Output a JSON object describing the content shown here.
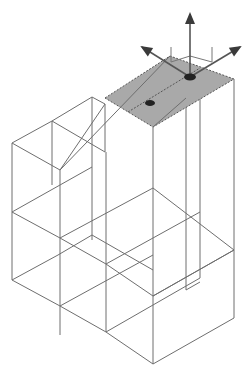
{
  "diagram": {
    "title": "",
    "colors": {
      "background": "#ffffff",
      "edge": "#6e6e6e",
      "selected_face": "#a9a9a9",
      "gizmo": "#3a3a3a"
    },
    "edges": [
      [
        12,
        143,
        52,
        121
      ],
      [
        52,
        121,
        92,
        97
      ],
      [
        12,
        143,
        12,
        280
      ],
      [
        52,
        121,
        52,
        185
      ],
      [
        92,
        97,
        92,
        240
      ],
      [
        12,
        143,
        60,
        170
      ],
      [
        52,
        121,
        105,
        152
      ],
      [
        92,
        97,
        105,
        104
      ],
      [
        60,
        170,
        60,
        335
      ],
      [
        60,
        170,
        105,
        104
      ],
      [
        12,
        212,
        60,
        238
      ],
      [
        12,
        212,
        92,
        167
      ],
      [
        60,
        238,
        153,
        188
      ],
      [
        12,
        280,
        60,
        306
      ],
      [
        60,
        306,
        153,
        255
      ],
      [
        60,
        306,
        106,
        332
      ],
      [
        12,
        280,
        58,
        255
      ],
      [
        58,
        255,
        92,
        235
      ],
      [
        92,
        235,
        153,
        270
      ],
      [
        60,
        238,
        106,
        264
      ],
      [
        106,
        332,
        153,
        305
      ],
      [
        106,
        264,
        153,
        238
      ],
      [
        106,
        332,
        106,
        264
      ],
      [
        106,
        264,
        106,
        152
      ],
      [
        105,
        104,
        105,
        152
      ],
      [
        153,
        127,
        153,
        364
      ],
      [
        106,
        332,
        153,
        364
      ],
      [
        153,
        364,
        234,
        318
      ],
      [
        153,
        296,
        234,
        250
      ],
      [
        106,
        264,
        153,
        296
      ],
      [
        153,
        305,
        200,
        278
      ],
      [
        153,
        238,
        200,
        212
      ],
      [
        234,
        79,
        234,
        318
      ],
      [
        200,
        90,
        200,
        278
      ],
      [
        186,
        98,
        186,
        290
      ],
      [
        153,
        296,
        234,
        250
      ],
      [
        186,
        290,
        200,
        282
      ],
      [
        153,
        188,
        234,
        250
      ]
    ],
    "selected_face": {
      "points": [
        [
          105,
          98
        ],
        [
          170,
          56
        ],
        [
          234,
          79
        ],
        [
          153,
          127
        ]
      ],
      "divider": [
        [
          128,
          112
        ],
        [
          200,
          68
        ]
      ],
      "handles": [
        [
          150,
          103
        ],
        [
          190,
          77
        ]
      ]
    },
    "gizmo": {
      "origin": [
        190,
        77
      ],
      "axes": [
        {
          "name": "up",
          "tip": [
            190,
            14
          ]
        },
        {
          "name": "left",
          "tip": [
            142,
            47
          ]
        },
        {
          "name": "right",
          "tip": [
            240,
            47
          ]
        }
      ],
      "bracket": [
        [
          171,
          47
        ],
        [
          171,
          62
        ],
        [
          190,
          56
        ],
        [
          212,
          62
        ],
        [
          212,
          47
        ]
      ]
    }
  }
}
